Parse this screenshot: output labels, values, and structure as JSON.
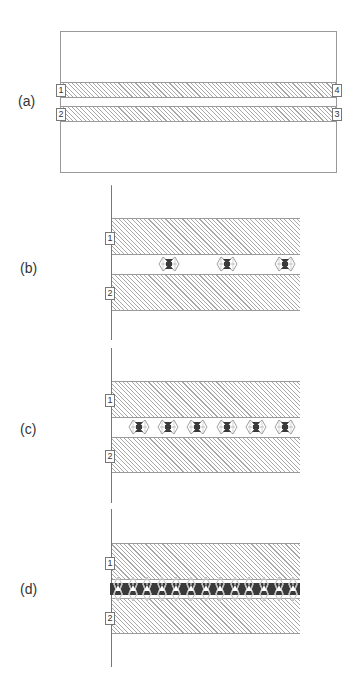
{
  "panels": {
    "a": {
      "label": "(a)",
      "tags": {
        "t1": "1",
        "t2": "2",
        "t3": "3",
        "t4": "4"
      }
    },
    "b": {
      "label": "(b)",
      "tags": {
        "t1": "1",
        "t2": "2"
      },
      "element_count": 3,
      "element_x": [
        169,
        227,
        285
      ]
    },
    "c": {
      "label": "(c)",
      "tags": {
        "t1": "1",
        "t2": "2"
      },
      "element_count": 6,
      "element_x": [
        139,
        168,
        197,
        227,
        256,
        285
      ]
    },
    "d": {
      "label": "(d)",
      "tags": {
        "t1": "1",
        "t2": "2"
      },
      "element_count": 13,
      "element_x": [
        118,
        132.6,
        147.2,
        161.8,
        176.4,
        191,
        205.6,
        220.2,
        234.8,
        249.4,
        264,
        278.6,
        293
      ]
    }
  },
  "colors": {
    "hatch": "#a8a8a8",
    "border": "#999999",
    "dark_band": "#3a3a3a",
    "element_fill": "#3a3a3a"
  }
}
